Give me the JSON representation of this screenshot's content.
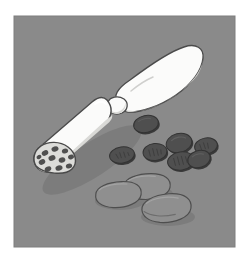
{
  "image": {
    "title": "Illustration of an opened wrapped food roll with scattered pieces",
    "subject": "wrapped-roll-with-scattered-pieces",
    "style": "flat cel-shaded vector illustration, grayscale",
    "canvas": {
      "width": 249,
      "height": 263,
      "background_color": "#ffffff"
    }
  },
  "panel": {
    "name": "gray-backdrop-panel",
    "x": 14,
    "y": 16,
    "width": 221,
    "height": 231,
    "fill_color": "#8a8a8a",
    "border_color": "#7e7e7e"
  },
  "palette": {
    "background_white": "#ffffff",
    "panel_gray": "#8a8a8a",
    "wrapper_white": "#fbfbfa",
    "wrapper_shade": "#e2e2e0",
    "wrapper_shade_deep": "#cfcfcd",
    "outline_dark": "#4a4a4a",
    "cut_face_gray": "#dcdcd9",
    "dark_piece": "#4f4f4f",
    "dark_piece_shadow": "#3a3a3a",
    "slice_gray": "#8f8f8f",
    "slice_highlight": "#9c9c9c",
    "cast_shadow": "#6f6f6f"
  },
  "objects": {
    "wrapper": {
      "name": "wrapped-roll",
      "label": "White wrapper roll, twisted at the middle, cut open at the lower-left end",
      "parts": [
        {
          "name": "upper-twisted-tail",
          "label": "Upper balloon-shaped twisted wrapper tail"
        },
        {
          "name": "twist-knot",
          "label": "Narrow twist knot joining the two halves"
        },
        {
          "name": "lower-body",
          "label": "Lower cylindrical body of the wrapped roll"
        },
        {
          "name": "cut-face",
          "label": "Oval cut face revealing embedded dark pieces"
        }
      ],
      "cut_face_spot_count": 11
    },
    "dark_pieces": {
      "name": "scattered-dark-pieces",
      "label": "Scattered dark oval pieces",
      "count": 7,
      "items": [
        {
          "cx": 146,
          "cy": 124,
          "rx": 12.5,
          "ry": 8.5,
          "rot": -12
        },
        {
          "cx": 122,
          "cy": 155,
          "rx": 12.5,
          "ry": 8.0,
          "rot": -8
        },
        {
          "cx": 155,
          "cy": 152,
          "rx": 12.0,
          "ry": 8.5,
          "rot": -6
        },
        {
          "cx": 179,
          "cy": 143,
          "rx": 13.0,
          "ry": 9.5,
          "rot": -14
        },
        {
          "cx": 206,
          "cy": 146,
          "rx": 11.5,
          "ry": 8.0,
          "rot": -10
        },
        {
          "cx": 181,
          "cy": 161,
          "rx": 13.5,
          "ry": 9.0,
          "rot": -8
        },
        {
          "cx": 199,
          "cy": 159,
          "rx": 11.5,
          "ry": 8.5,
          "rot": -18
        }
      ]
    },
    "slices": {
      "name": "light-slices",
      "label": "Light gray flat rounded slices resting on the surface",
      "count": 3,
      "items": [
        {
          "cx": 118,
          "cy": 195,
          "rx": 24,
          "ry": 15,
          "rot": -6
        },
        {
          "cx": 146,
          "cy": 188,
          "rx": 24,
          "ry": 15,
          "rot": -4
        },
        {
          "cx": 166,
          "cy": 210,
          "rx": 26,
          "ry": 16,
          "rot": -4
        }
      ]
    }
  }
}
